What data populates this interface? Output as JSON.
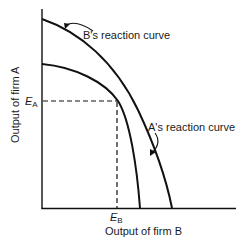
{
  "diagram": {
    "type": "reaction-curves",
    "axes": {
      "y_label": "Output of firm A",
      "x_label": "Output of firm B"
    },
    "curves": [
      {
        "id": "b-reaction",
        "label": "B's reaction curve"
      },
      {
        "id": "a-reaction",
        "label": "A's reaction curve"
      }
    ],
    "equilibrium": {
      "y_marker": {
        "main": "E",
        "sub": "A"
      },
      "x_marker": {
        "main": "E",
        "sub": "B"
      }
    },
    "colors": {
      "line": "#111111",
      "text": "#1a1a1a",
      "background": "#ffffff"
    }
  }
}
